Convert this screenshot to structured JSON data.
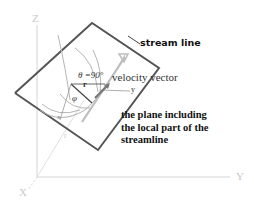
{
  "diagram": {
    "axes": {
      "z_label": "Z",
      "x_label": "X",
      "y_label": "Y"
    },
    "labels": {
      "stream_line": "stream line",
      "velocity_vector": "velocity vector",
      "theta": "θ =90°",
      "phi": "φ",
      "r_vector": "r",
      "local_y": "y",
      "local_x": "x",
      "origin_r": "r",
      "plane_description_line1": "the plane including",
      "plane_description_line2": "the local part of the",
      "plane_description_line3": "streamline"
    },
    "colors": {
      "plane_edge": "#555555",
      "axis": "#d0d0d0",
      "streamline": "#aaaaaa",
      "text": "#111111"
    }
  }
}
